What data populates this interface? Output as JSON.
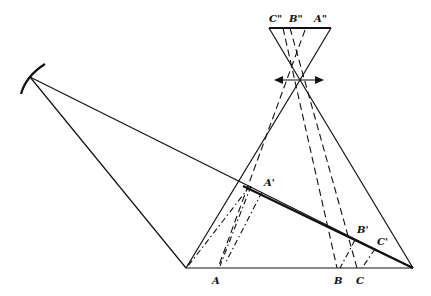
{
  "diagram": {
    "type": "optics-ray-diagram",
    "labels": {
      "c_dbl": "C\"",
      "b_dbl": "B\"",
      "a_dbl": "A\"",
      "a_prime": "A'",
      "b_prime": "B'",
      "c_prime": "C'",
      "a": "A",
      "b": "B",
      "c": "C"
    },
    "elements": [
      "mirror",
      "lens",
      "image-plane",
      "object-plane",
      "tilted-plane"
    ],
    "colors": {
      "line": "#111111",
      "background": "#ffffff"
    }
  }
}
